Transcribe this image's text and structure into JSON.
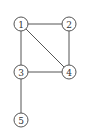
{
  "graph": {
    "nodes": [
      {
        "id": "1",
        "label": "1",
        "x": 21,
        "y": 24
      },
      {
        "id": "2",
        "label": "2",
        "x": 69,
        "y": 24
      },
      {
        "id": "3",
        "label": "3",
        "x": 21,
        "y": 72
      },
      {
        "id": "4",
        "label": "4",
        "x": 69,
        "y": 72
      },
      {
        "id": "5",
        "label": "5",
        "x": 21,
        "y": 120
      }
    ],
    "edges": [
      {
        "from": "1",
        "to": "2"
      },
      {
        "from": "1",
        "to": "3"
      },
      {
        "from": "1",
        "to": "4"
      },
      {
        "from": "2",
        "to": "4"
      },
      {
        "from": "3",
        "to": "4"
      },
      {
        "from": "3",
        "to": "5"
      }
    ],
    "node_radius": 7,
    "colors": {
      "stroke": "#555555",
      "fill": "#ffffff",
      "text": "#333333",
      "background": "#ffffff"
    }
  }
}
